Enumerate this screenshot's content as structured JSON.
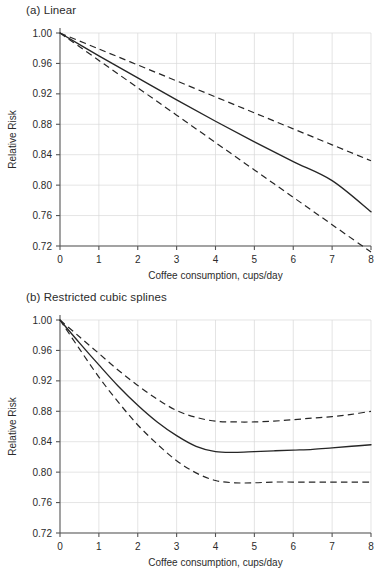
{
  "figure": {
    "background": "#ffffff",
    "line_color": "#262626",
    "grid_color": "#d9d9d9",
    "axis_color": "#555555"
  },
  "panels": [
    {
      "id": "a",
      "title": "(a) Linear",
      "xlabel": "Coffee consumption, cups/day",
      "ylabel": "Relative Risk"
    },
    {
      "id": "b",
      "title": "(b) Restricted cubic splines",
      "xlabel": "Coffee consumption, cups/day",
      "ylabel": "Relative Risk"
    }
  ],
  "chart_data": [
    {
      "type": "line",
      "title": "(a) Linear",
      "xlabel": "Coffee consumption, cups/day",
      "ylabel": "Relative Risk",
      "xlim": [
        0,
        8
      ],
      "ylim": [
        0.72,
        1.0
      ],
      "xticks": [
        0,
        1,
        2,
        3,
        4,
        5,
        6,
        7,
        8
      ],
      "xtick_labels": [
        "0",
        "1",
        "2",
        "3",
        "4",
        "5",
        "6",
        "7",
        "8"
      ],
      "yticks": [
        0.72,
        0.76,
        0.8,
        0.84,
        0.88,
        0.92,
        0.96,
        1.0
      ],
      "ytick_labels": [
        "0.72",
        "0.76",
        "0.80",
        "0.84",
        "0.88",
        "0.92",
        "0.96",
        "1.00"
      ],
      "grid": true,
      "legend": "none",
      "x": [
        0,
        1,
        2,
        3,
        4,
        5,
        6,
        7,
        8
      ],
      "series": [
        {
          "name": "Pooled relative risk",
          "style": "solid",
          "values": [
            1.0,
            0.97,
            0.941,
            0.912,
            0.884,
            0.857,
            0.831,
            0.806,
            0.765
          ]
        },
        {
          "name": "Upper 95% confidence limit",
          "style": "dashed",
          "values": [
            1.0,
            0.979,
            0.958,
            0.937,
            0.916,
            0.895,
            0.874,
            0.853,
            0.832
          ]
        },
        {
          "name": "Lower 95% confidence limit",
          "style": "dashed",
          "values": [
            1.0,
            0.964,
            0.928,
            0.892,
            0.856,
            0.82,
            0.784,
            0.748,
            0.712
          ]
        }
      ]
    },
    {
      "type": "line",
      "title": "(b) Restricted cubic splines",
      "xlabel": "Coffee consumption, cups/day",
      "ylabel": "Relative Risk",
      "xlim": [
        0,
        8
      ],
      "ylim": [
        0.72,
        1.0
      ],
      "xticks": [
        0,
        1,
        2,
        3,
        4,
        5,
        6,
        7,
        8
      ],
      "xtick_labels": [
        "0",
        "1",
        "2",
        "3",
        "4",
        "5",
        "6",
        "7",
        "8"
      ],
      "yticks": [
        0.72,
        0.76,
        0.8,
        0.84,
        0.88,
        0.92,
        0.96,
        1.0
      ],
      "ytick_labels": [
        "0.72",
        "0.76",
        "0.80",
        "0.84",
        "0.88",
        "0.92",
        "0.96",
        "1.00"
      ],
      "grid": true,
      "legend": "none",
      "x": [
        0,
        0.5,
        1,
        1.5,
        2,
        2.5,
        3,
        3.5,
        4,
        4.5,
        5,
        5.5,
        6,
        6.5,
        7,
        7.5,
        8
      ],
      "series": [
        {
          "name": "Pooled relative risk",
          "style": "solid",
          "values": [
            1.0,
            0.97,
            0.941,
            0.913,
            0.888,
            0.866,
            0.848,
            0.834,
            0.827,
            0.826,
            0.827,
            0.828,
            0.829,
            0.83,
            0.832,
            0.834,
            0.836
          ]
        },
        {
          "name": "Upper 95% confidence limit",
          "style": "dashed",
          "values": [
            1.0,
            0.978,
            0.956,
            0.934,
            0.914,
            0.896,
            0.881,
            0.872,
            0.867,
            0.866,
            0.866,
            0.867,
            0.869,
            0.871,
            0.873,
            0.876,
            0.88
          ]
        },
        {
          "name": "Lower 95% confidence limit",
          "style": "dashed",
          "values": [
            1.0,
            0.962,
            0.925,
            0.892,
            0.862,
            0.837,
            0.815,
            0.799,
            0.789,
            0.786,
            0.786,
            0.787,
            0.787,
            0.787,
            0.787,
            0.787,
            0.787
          ]
        }
      ]
    }
  ]
}
